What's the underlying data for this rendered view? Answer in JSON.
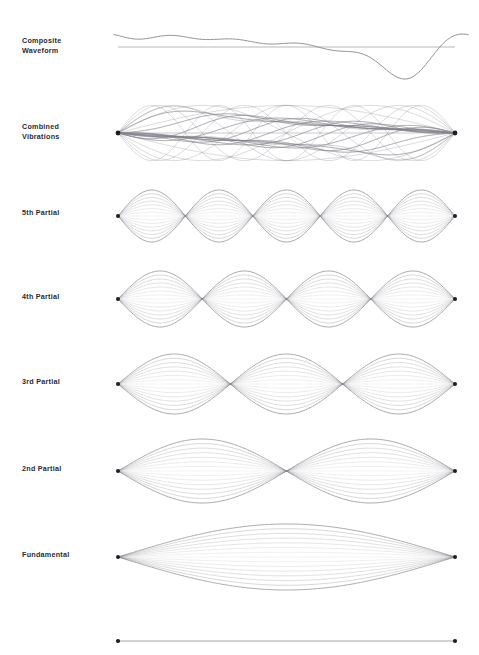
{
  "figure": {
    "title_implicit": "Vibrating string harmonics / standing wave partials",
    "background_color": "#ffffff",
    "width": 479,
    "height": 655,
    "plot_left_x": 118,
    "plot_right_x": 455,
    "colors": {
      "label_text": "#2b2b33",
      "curve": "#7c7c86",
      "axis": "#9a9aa2",
      "node_dot": "#1d1d22"
    }
  },
  "rows": [
    {
      "id": "composite-waveform",
      "label": "Composite\nWaveform",
      "label_center_y": 47,
      "kind": "waveform",
      "center_y": 47,
      "amplitude": 22,
      "has_axis_line": true,
      "axis_y": 47,
      "axis_x1": 118,
      "axis_x2": 455,
      "curve_x1": 114,
      "curve_x2": 468,
      "snapshots": 1,
      "harmonics": [
        1,
        2,
        3,
        4,
        5
      ],
      "harmonic_amplitudes": [
        1.0,
        0.62,
        0.42,
        0.3,
        0.22
      ],
      "harmonic_phases": [
        0.0,
        0.9,
        1.9,
        2.7,
        3.5
      ]
    },
    {
      "id": "combined-vibrations",
      "label": "Combined\nVibrations",
      "label_center_y": 133,
      "kind": "superposition",
      "center_y": 133,
      "amplitude": 30,
      "lobes": 1,
      "snapshots": 26,
      "harmonics": [
        1,
        2,
        3,
        4,
        5
      ],
      "harmonic_amplitudes": [
        1.0,
        0.62,
        0.42,
        0.3,
        0.22
      ],
      "x1": 118,
      "x2": 455
    },
    {
      "id": "partial-5",
      "label": "5th Partial",
      "label_center_y": 214,
      "kind": "standing-wave",
      "mode": 5,
      "center_y": 216,
      "amplitude": 26,
      "snapshots": 15,
      "lobes": 5,
      "x1": 118,
      "x2": 455
    },
    {
      "id": "partial-4",
      "label": "4th Partial",
      "label_center_y": 298,
      "kind": "standing-wave",
      "mode": 4,
      "center_y": 299,
      "amplitude": 28,
      "snapshots": 15,
      "lobes": 4,
      "x1": 118,
      "x2": 455
    },
    {
      "id": "partial-3",
      "label": "3rd Partial",
      "label_center_y": 383,
      "kind": "standing-wave",
      "mode": 3,
      "center_y": 384,
      "amplitude": 30,
      "snapshots": 15,
      "lobes": 3,
      "x1": 118,
      "x2": 455
    },
    {
      "id": "partial-2",
      "label": "2nd Partial",
      "label_center_y": 470,
      "kind": "standing-wave",
      "mode": 2,
      "center_y": 471,
      "amplitude": 32,
      "snapshots": 15,
      "lobes": 2,
      "x1": 118,
      "x2": 455
    },
    {
      "id": "fundamental",
      "label": "Fundamental",
      "label_center_y": 556,
      "kind": "standing-wave",
      "mode": 1,
      "center_y": 557,
      "amplitude": 33,
      "snapshots": 15,
      "lobes": 1,
      "x1": 118,
      "x2": 455
    },
    {
      "id": "string-at-rest",
      "label": "",
      "label_center_y": 640,
      "kind": "rest-string",
      "center_y": 641,
      "amplitude": 0,
      "snapshots": 1,
      "lobes": 0,
      "x1": 118,
      "x2": 455
    }
  ],
  "chart_data": {
    "type": "line",
    "title": "",
    "xlabel": "",
    "ylabel": "",
    "grid": false,
    "legend": "none",
    "series": [
      {
        "name": "Composite Waveform",
        "harmonic": 0,
        "amplitude": 1.0,
        "nodes": 0,
        "antinodes": 0
      },
      {
        "name": "Combined Vibrations",
        "harmonic": 0,
        "amplitude": 1.0,
        "nodes": 2,
        "antinodes": 0
      },
      {
        "name": "5th Partial",
        "harmonic": 5,
        "amplitude": 0.22,
        "nodes": 6,
        "antinodes": 5
      },
      {
        "name": "4th Partial",
        "harmonic": 4,
        "amplitude": 0.3,
        "nodes": 5,
        "antinodes": 4
      },
      {
        "name": "3rd Partial",
        "harmonic": 3,
        "amplitude": 0.42,
        "nodes": 4,
        "antinodes": 3
      },
      {
        "name": "2nd Partial",
        "harmonic": 2,
        "amplitude": 0.62,
        "nodes": 3,
        "antinodes": 2
      },
      {
        "name": "Fundamental",
        "harmonic": 1,
        "amplitude": 1.0,
        "nodes": 2,
        "antinodes": 1
      },
      {
        "name": "String at rest",
        "harmonic": 0,
        "amplitude": 0.0,
        "nodes": 2,
        "antinodes": 0
      }
    ]
  }
}
